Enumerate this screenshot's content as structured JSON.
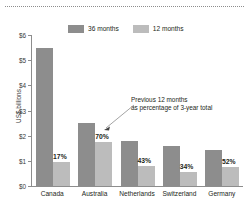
{
  "chart_data": {
    "type": "bar",
    "title": "",
    "subtitle": "",
    "xlabel": "",
    "ylabel": "US$ billions",
    "ylim": [
      0,
      6
    ],
    "grid": false,
    "legend_position": "top",
    "categories": [
      "Canada",
      "Australia",
      "Netherlands",
      "Switzerland",
      "Germany"
    ],
    "ytick_labels": [
      "$0",
      "$1",
      "$2",
      "$3",
      "$4",
      "$5",
      "$6"
    ],
    "ytick_values": [
      0,
      1,
      2,
      3,
      4,
      5,
      6
    ],
    "series": [
      {
        "name": "36 months",
        "color": "#8d8d8d",
        "values": [
          5.5,
          2.5,
          1.8,
          1.6,
          1.45
        ]
      },
      {
        "name": "12 months",
        "color": "#bcbcbc",
        "values": [
          0.95,
          1.75,
          0.78,
          0.55,
          0.76
        ]
      }
    ],
    "data_labels": [
      "17%",
      "70%",
      "43%",
      "34%",
      "52%"
    ],
    "annotations": [
      {
        "line1": "Previous 12 months",
        "line2": "as percentage of 3-year total",
        "points_to": "Australia"
      }
    ]
  },
  "legend": {
    "items": [
      {
        "label": "36 months",
        "color": "#8d8d8d"
      },
      {
        "label": "12 months",
        "color": "#bcbcbc"
      }
    ]
  },
  "axis": {
    "y_title": "US$ billions",
    "y_ticks": [
      {
        "label": "$6",
        "value": 6
      },
      {
        "label": "$5",
        "value": 5
      },
      {
        "label": "$4",
        "value": 4
      },
      {
        "label": "$3",
        "value": 3
      },
      {
        "label": "$2",
        "value": 2
      },
      {
        "label": "$1",
        "value": 1
      },
      {
        "label": "$0",
        "value": 0
      }
    ]
  },
  "annotation": {
    "line1": "Previous 12 months",
    "line2": "as percentage of 3-year total"
  },
  "colors": {
    "bar_36": "#8d8d8d",
    "bar_12": "#bcbcbc",
    "axis": "#8d8d8d",
    "text": "#231f20"
  }
}
